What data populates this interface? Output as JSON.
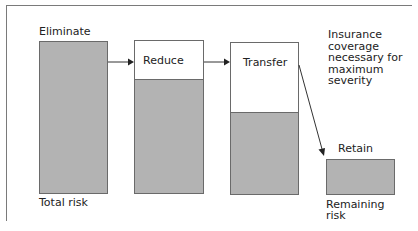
{
  "diagram": {
    "stages": [
      {
        "label": "Eliminate",
        "shaded_fraction": 1.0
      },
      {
        "label": "Reduce",
        "shaded_fraction": 0.74
      },
      {
        "label": "Transfer",
        "shaded_fraction": 0.53
      },
      {
        "label": "Retain",
        "shaded_fraction": 1.0
      }
    ],
    "bottom_labels": {
      "total": "Total risk",
      "remaining": "Remaining\nrisk"
    },
    "note": "Insurance\ncoverage\nnecessary for\nmaximum\nseverity",
    "colors": {
      "fill": "#b3b3b3",
      "line": "#6a6a6a",
      "frame": "#7a7a7a"
    }
  }
}
